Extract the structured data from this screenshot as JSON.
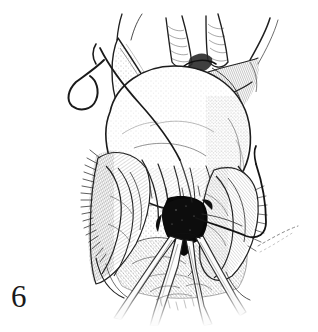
{
  "figure": {
    "number": "6",
    "caption": "",
    "medium": "pen-and-ink line drawing",
    "background_color": "#ffffff",
    "ink_color": "#1a1a1a"
  },
  "illustration": {
    "title": "",
    "description": "Pen-and-ink surgical illustration of an exposed uterus with adnexa, a curved suture needle with thread at upper left, a second suture loop at right, a dark incision site at center, and converging forceps blades entering from below.",
    "elements": [
      {
        "name": "uterine-fundus",
        "label": "",
        "tone": "light",
        "shading": "stipple"
      },
      {
        "name": "left-fallopian-tube",
        "label": "",
        "tone": "light",
        "shading": "stipple"
      },
      {
        "name": "right-round-ligament",
        "label": "",
        "tone": "mid",
        "shading": "cross-hatch"
      },
      {
        "name": "upper-vessel-pedicle",
        "label": "",
        "tone": "mid",
        "shading": "hatch"
      },
      {
        "name": "left-adnexal-fimbriae",
        "label": "",
        "tone": "mid",
        "shading": "fine-hatch"
      },
      {
        "name": "right-adnexal-fold",
        "label": "",
        "tone": "mid",
        "shading": "fine-hatch"
      },
      {
        "name": "incision-cavity",
        "label": "",
        "tone": "solid-black",
        "shading": "solid"
      },
      {
        "name": "curved-suture-needle",
        "label": "",
        "tone": "dark",
        "shading": "line"
      },
      {
        "name": "suture-thread-left",
        "label": "",
        "tone": "dark",
        "shading": "line"
      },
      {
        "name": "suture-thread-right",
        "label": "",
        "tone": "dark",
        "shading": "line"
      },
      {
        "name": "suture-tail-stippled",
        "label": "",
        "tone": "faint",
        "shading": "dashed"
      },
      {
        "name": "forceps-blade-group",
        "label": "",
        "tone": "light",
        "shading": "outline"
      }
    ]
  }
}
